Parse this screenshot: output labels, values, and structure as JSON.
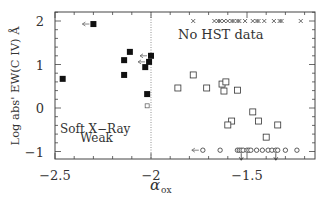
{
  "chart_data": {
    "type": "scatter",
    "title": "",
    "xlabel": "α_ox",
    "ylabel": "Log abs' EW(C IV) Å",
    "xlim": [
      -2.5,
      -1.15
    ],
    "ylim": [
      -1.18,
      2.18
    ],
    "xticks": [
      -2.5,
      -2,
      -1.5
    ],
    "xtick_labels": [
      "−2.5",
      "−2",
      "−1.5"
    ],
    "yticks": [
      -1,
      0,
      1,
      2
    ],
    "ytick_labels": [
      "−1",
      "0",
      "1",
      "2"
    ],
    "grid": false,
    "reference_line": {
      "x": -2.0,
      "style": "dotted"
    },
    "annotations": [
      {
        "text": "No HST data",
        "x": -1.55,
        "y": 1.72
      },
      {
        "text": "Soft X-Ray",
        "x": -2.35,
        "y": -0.55
      },
      {
        "text": "Weak",
        "x": -2.35,
        "y": -0.75
      }
    ],
    "series": [
      {
        "name": "Soft X-ray weak (filled squares)",
        "marker": "filled-square",
        "points": [
          {
            "x": -2.3,
            "y": 1.93,
            "upper_limit_x": true
          },
          {
            "x": -2.46,
            "y": 0.67
          },
          {
            "x": -2.11,
            "y": 1.29
          },
          {
            "x": -2.14,
            "y": 1.1
          },
          {
            "x": -2.14,
            "y": 0.76
          },
          {
            "x": -2.0,
            "y": 1.2,
            "upper_limit_x": true
          },
          {
            "x": -2.01,
            "y": 1.06,
            "upper_limit_x": true
          },
          {
            "x": -2.03,
            "y": 0.94
          },
          {
            "x": -2.02,
            "y": 0.32
          }
        ]
      },
      {
        "name": "Marginal (open small square)",
        "marker": "open-small-square",
        "points": [
          {
            "x": -2.02,
            "y": 0.05
          }
        ]
      },
      {
        "name": "Detected C IV (open squares)",
        "marker": "open-square",
        "points": [
          {
            "x": -1.86,
            "y": 0.46
          },
          {
            "x": -1.78,
            "y": 0.76
          },
          {
            "x": -1.71,
            "y": 0.46
          },
          {
            "x": -1.63,
            "y": 0.55
          },
          {
            "x": -1.61,
            "y": 0.6
          },
          {
            "x": -1.62,
            "y": 0.39
          },
          {
            "x": -1.55,
            "y": 0.41
          },
          {
            "x": -1.47,
            "y": -0.09
          },
          {
            "x": -1.58,
            "y": -0.3
          },
          {
            "x": -1.6,
            "y": -0.39
          },
          {
            "x": -1.44,
            "y": -0.3
          },
          {
            "x": -1.34,
            "y": -0.39
          },
          {
            "x": -1.4,
            "y": -0.67
          }
        ]
      },
      {
        "name": "No C IV measured (open circles)",
        "marker": "open-circle",
        "points": [
          {
            "x": -1.73,
            "y": -0.97,
            "upper_limit_x": true
          },
          {
            "x": -1.64,
            "y": -0.97
          },
          {
            "x": -1.55,
            "y": -0.97
          },
          {
            "x": -1.54,
            "y": -0.97
          },
          {
            "x": -1.53,
            "y": -0.97,
            "upper_limit_y": true
          },
          {
            "x": -1.52,
            "y": -0.97
          },
          {
            "x": -1.5,
            "y": -0.97
          },
          {
            "x": -1.49,
            "y": -0.97
          },
          {
            "x": -1.48,
            "y": -0.97
          },
          {
            "x": -1.45,
            "y": -0.97
          },
          {
            "x": -1.42,
            "y": -0.97
          },
          {
            "x": -1.39,
            "y": -0.97
          },
          {
            "x": -1.37,
            "y": -0.97
          },
          {
            "x": -1.35,
            "y": -0.97,
            "upper_limit_y": true
          },
          {
            "x": -1.34,
            "y": -0.97
          },
          {
            "x": -1.3,
            "y": -0.97
          },
          {
            "x": -1.24,
            "y": -0.97
          }
        ]
      },
      {
        "name": "No HST data (crosses)",
        "marker": "cross",
        "points": [
          {
            "x": -1.78,
            "y": 2.0
          },
          {
            "x": -1.67,
            "y": 2.0
          },
          {
            "x": -1.65,
            "y": 2.0
          },
          {
            "x": -1.64,
            "y": 2.0
          },
          {
            "x": -1.62,
            "y": 2.0
          },
          {
            "x": -1.6,
            "y": 2.0
          },
          {
            "x": -1.58,
            "y": 2.0
          },
          {
            "x": -1.57,
            "y": 2.0
          },
          {
            "x": -1.55,
            "y": 2.0
          },
          {
            "x": -1.54,
            "y": 2.0
          },
          {
            "x": -1.51,
            "y": 2.0
          },
          {
            "x": -1.47,
            "y": 2.0
          },
          {
            "x": -1.45,
            "y": 2.0
          },
          {
            "x": -1.44,
            "y": 2.0
          },
          {
            "x": -1.41,
            "y": 2.0
          },
          {
            "x": -1.36,
            "y": 2.0
          },
          {
            "x": -1.33,
            "y": 2.0
          },
          {
            "x": -1.32,
            "y": 2.0
          },
          {
            "x": -1.22,
            "y": 2.0
          }
        ]
      }
    ]
  },
  "labels": {
    "annotation_no_hst": "No HST data",
    "annotation_soft1": "Soft X−Ray",
    "annotation_soft2": "Weak",
    "ylabel": "Log abs' EW(C IV) Å",
    "xlabel_symbol": "α",
    "xlabel_sub": "ox"
  }
}
